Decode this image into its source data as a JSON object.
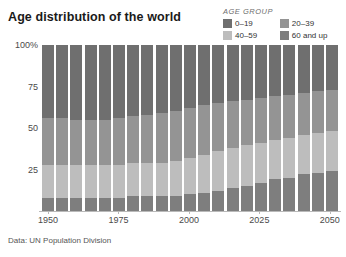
{
  "title": "Age distribution of the world",
  "footer": "Data: UN Population Division",
  "legend": {
    "title": "AGE GROUP",
    "items": [
      {
        "label": "0–19",
        "color": "#6f6f6f"
      },
      {
        "label": "20–39",
        "color": "#949494"
      },
      {
        "label": "40–59",
        "color": "#bdbdbd"
      },
      {
        "label": "60 and up",
        "color": "#7e7e7e"
      }
    ]
  },
  "chart_data": {
    "type": "bar",
    "title": "Age distribution of the world",
    "subtitle": "",
    "xlabel": "",
    "ylabel": "",
    "stacked": true,
    "stack_order_top_to_bottom": [
      "0–19",
      "20–39",
      "40–59",
      "60 and up"
    ],
    "ylim": [
      0,
      100
    ],
    "yticks": [
      "25",
      "50",
      "75",
      "100%"
    ],
    "ytick_values": [
      25,
      50,
      75,
      100
    ],
    "grid": false,
    "legend_position": "top-right",
    "xticks": [
      "1950",
      "1975",
      "2000",
      "2025",
      "2050"
    ],
    "xtick_values": [
      1950,
      1975,
      2000,
      2025,
      2050
    ],
    "categories": [
      "1950",
      "1955",
      "1960",
      "1965",
      "1970",
      "1975",
      "1980",
      "1985",
      "1990",
      "1995",
      "2000",
      "2005",
      "2010",
      "2015",
      "2020",
      "2025",
      "2030",
      "2035",
      "2040",
      "2045",
      "2050"
    ],
    "series": [
      {
        "name": "0–19",
        "color": "#6f6f6f",
        "values": [
          44,
          44,
          45,
          45,
          45,
          44,
          43,
          42,
          41,
          40,
          38,
          36,
          35,
          34,
          33,
          32,
          31,
          30,
          29,
          28,
          27
        ]
      },
      {
        "name": "20–39",
        "color": "#949494",
        "values": [
          28,
          28,
          27,
          27,
          27,
          28,
          28,
          29,
          30,
          30,
          30,
          30,
          29,
          28,
          27,
          27,
          26,
          26,
          25,
          25,
          25
        ]
      },
      {
        "name": "40–59",
        "color": "#bdbdbd",
        "values": [
          20,
          20,
          20,
          20,
          20,
          20,
          20,
          20,
          20,
          21,
          22,
          23,
          24,
          24,
          25,
          24,
          24,
          24,
          24,
          24,
          24
        ]
      },
      {
        "name": "60 and up",
        "color": "#7e7e7e",
        "values": [
          8,
          8,
          8,
          8,
          8,
          8,
          9,
          9,
          9,
          9,
          10,
          11,
          12,
          14,
          15,
          17,
          19,
          20,
          22,
          23,
          24
        ]
      }
    ]
  }
}
